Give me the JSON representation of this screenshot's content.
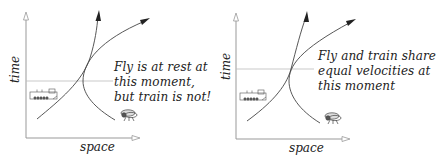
{
  "panels": [
    {
      "id": "left",
      "x_axis_label": "space",
      "y_axis_label": "time",
      "caption_lines": [
        "Fly is at rest at",
        "this moment,",
        "but train is not!"
      ],
      "train_icon": "train-icon",
      "fly_icon": "fly-icon",
      "moment_line": "horizontal reference line at the moment fly is at rest"
    },
    {
      "id": "right",
      "x_axis_label": "space",
      "y_axis_label": "time",
      "caption_lines": [
        "Fly and train share",
        "equal velocities at",
        "this moment"
      ],
      "train_icon": "train-icon",
      "fly_icon": "fly-icon",
      "moment_line": "horizontal reference line at the moment of equal velocities"
    }
  ],
  "colors": {
    "axis": "#999999",
    "curve": "#444444",
    "reference_line": "#aaaaaa",
    "text": "#222222"
  }
}
